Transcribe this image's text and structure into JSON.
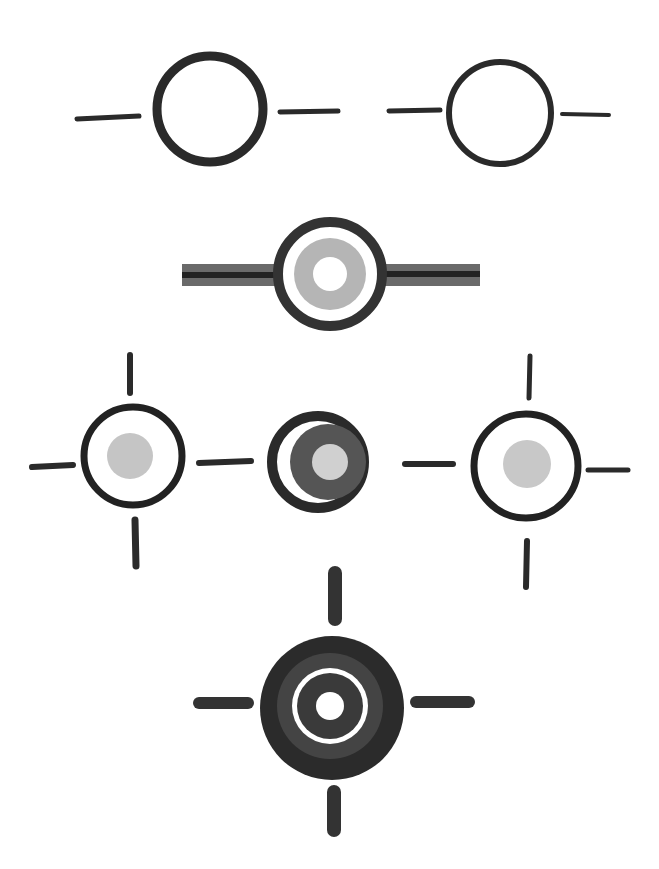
{
  "canvas": {
    "width": 659,
    "height": 869,
    "background": "#ffffff"
  },
  "colors": {
    "ink": "#2a2a2a",
    "dark_fill": "#2e2e2e",
    "mid_fill": "#555555",
    "light_fill": "#c8c8c8",
    "white": "#ffffff"
  },
  "symbols": [
    {
      "id": "plain-circle-with-side-ticks-1",
      "cx": 210,
      "cy": 109,
      "r": 54
    },
    {
      "id": "plain-circle-with-side-ticks-2",
      "cx": 500,
      "cy": 113,
      "r": 52
    },
    {
      "id": "ringed-circle-with-bar",
      "cx": 330,
      "cy": 274,
      "r": 56
    },
    {
      "id": "crosshair-light-dot-left",
      "cx": 133,
      "cy": 456,
      "r": 50
    },
    {
      "id": "target-dark-center",
      "cx": 318,
      "cy": 462,
      "r": 50
    },
    {
      "id": "crosshair-light-dot-right",
      "cx": 526,
      "cy": 466,
      "r": 52
    },
    {
      "id": "bold-target-crosshair",
      "cx": 332,
      "cy": 708,
      "r": 72
    }
  ]
}
